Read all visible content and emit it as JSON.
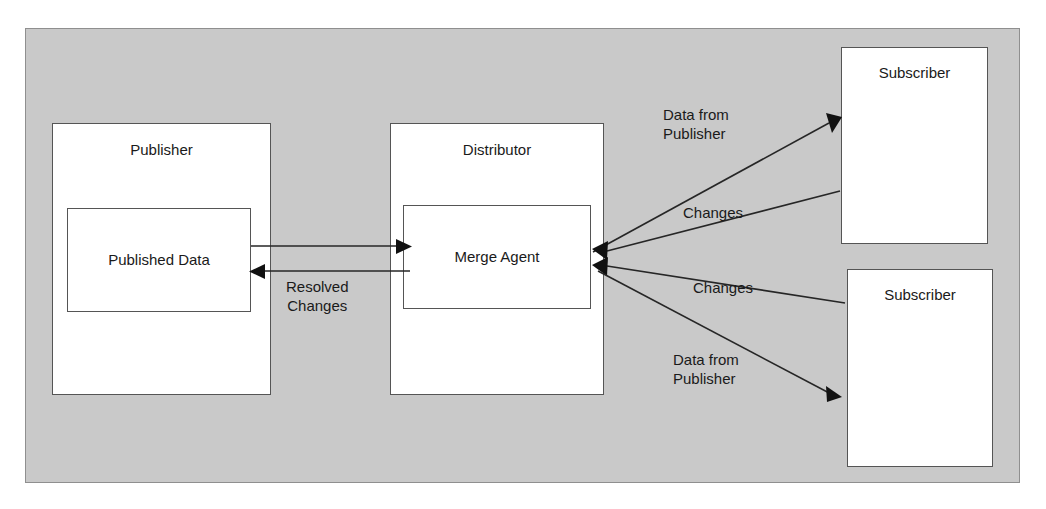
{
  "diagram": {
    "background_color": "#ffffff",
    "panel_color": "#c9c9c9",
    "panel_border_color": "#8f8f8f",
    "node_fill": "#ffffff",
    "node_border": "#555555",
    "line_color": "#262626"
  },
  "nodes": {
    "publisher": {
      "label": "Publisher"
    },
    "published_data": {
      "label": "Published Data"
    },
    "distributor": {
      "label": "Distributor"
    },
    "merge_agent": {
      "label": "Merge Agent"
    },
    "subscriber_1": {
      "label": "Subscriber"
    },
    "subscriber_2": {
      "label": "Subscriber"
    }
  },
  "edges": [
    {
      "id": "publisher-to-merge-agent",
      "label": "",
      "from": "published_data",
      "to": "merge_agent",
      "direction": "right"
    },
    {
      "id": "merge-agent-to-publisher",
      "label": "Resolved\nChanges",
      "from": "merge_agent",
      "to": "published_data",
      "direction": "left"
    },
    {
      "id": "merge-agent-to-subscriber-1",
      "label": "Data from\nPublisher",
      "from": "merge_agent",
      "to": "subscriber_1",
      "direction": "up-right"
    },
    {
      "id": "subscriber-1-to-merge-agent",
      "label": "Changes",
      "from": "subscriber_1",
      "to": "merge_agent",
      "direction": "down-left"
    },
    {
      "id": "subscriber-2-to-merge-agent",
      "label": "Changes",
      "from": "subscriber_2",
      "to": "merge_agent",
      "direction": "up-left"
    },
    {
      "id": "merge-agent-to-subscriber-2",
      "label": "Data from\nPublisher",
      "from": "merge_agent",
      "to": "subscriber_2",
      "direction": "down-right"
    }
  ],
  "labels": {
    "resolved_changes": "Resolved\nChanges",
    "data_from_publisher_top": "Data from\nPublisher",
    "changes_top": "Changes",
    "changes_bottom": "Changes",
    "data_from_publisher_bottom": "Data from\nPublisher"
  }
}
